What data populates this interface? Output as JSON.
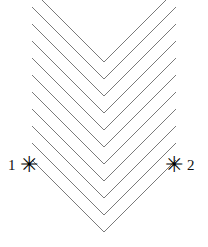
{
  "figure": {
    "background_color": "#ffffff",
    "line_color": "#7a7a7a",
    "line_width": 1,
    "width": 208,
    "height": 247
  },
  "markers": [
    {
      "id": "marker-1",
      "label": "1",
      "glyph": "asterisk-marker",
      "glyph_char": "✳",
      "side": "left",
      "x": 30,
      "y": 165,
      "color": "#000000"
    },
    {
      "id": "marker-2",
      "label": "2",
      "glyph": "asterisk-marker",
      "glyph_char": "✳",
      "side": "right",
      "x": 177,
      "y": 165,
      "color": "#000000"
    }
  ],
  "chart_data": {
    "type": "line",
    "xlabel": "",
    "ylabel": "",
    "xlim": [
      0,
      208
    ],
    "ylim": [
      0,
      247
    ],
    "grid": false,
    "legend": "none",
    "axis_of_symmetry_x": 104,
    "arm_slope_left": 1.0,
    "arm_slope_right": -1.0,
    "chevron_count": 11,
    "vertical_offset": 17,
    "series": [
      {
        "name": "chevron-1",
        "apex": [
          104,
          62
        ],
        "left_end": [
          32,
          -10
        ],
        "right_end": [
          176,
          -10
        ]
      },
      {
        "name": "chevron-2",
        "apex": [
          104,
          79
        ],
        "left_end": [
          32,
          7
        ],
        "right_end": [
          176,
          7
        ]
      },
      {
        "name": "chevron-3",
        "apex": [
          104,
          96
        ],
        "left_end": [
          32,
          24
        ],
        "right_end": [
          176,
          24
        ]
      },
      {
        "name": "chevron-4",
        "apex": [
          104,
          113
        ],
        "left_end": [
          32,
          41
        ],
        "right_end": [
          176,
          41
        ]
      },
      {
        "name": "chevron-5",
        "apex": [
          104,
          130
        ],
        "left_end": [
          32,
          58
        ],
        "right_end": [
          176,
          58
        ]
      },
      {
        "name": "chevron-6",
        "apex": [
          104,
          147
        ],
        "left_end": [
          32,
          75
        ],
        "right_end": [
          176,
          75
        ]
      },
      {
        "name": "chevron-7",
        "apex": [
          104,
          164
        ],
        "left_end": [
          32,
          92
        ],
        "right_end": [
          176,
          92
        ]
      },
      {
        "name": "chevron-8",
        "apex": [
          104,
          181
        ],
        "left_end": [
          32,
          109
        ],
        "right_end": [
          176,
          109
        ]
      },
      {
        "name": "chevron-9",
        "apex": [
          104,
          198
        ],
        "left_end": [
          32,
          126
        ],
        "right_end": [
          176,
          126
        ]
      },
      {
        "name": "chevron-10",
        "apex": [
          104,
          215
        ],
        "left_end": [
          32,
          143
        ],
        "right_end": [
          176,
          143
        ]
      },
      {
        "name": "chevron-11",
        "apex": [
          104,
          232
        ],
        "left_end": [
          32,
          160
        ],
        "right_end": [
          176,
          160
        ]
      }
    ],
    "annotations": [
      {
        "text": "1",
        "x": 14,
        "y": 165,
        "marker": "asterisk"
      },
      {
        "text": "2",
        "x": 193,
        "y": 165,
        "marker": "asterisk"
      }
    ]
  }
}
